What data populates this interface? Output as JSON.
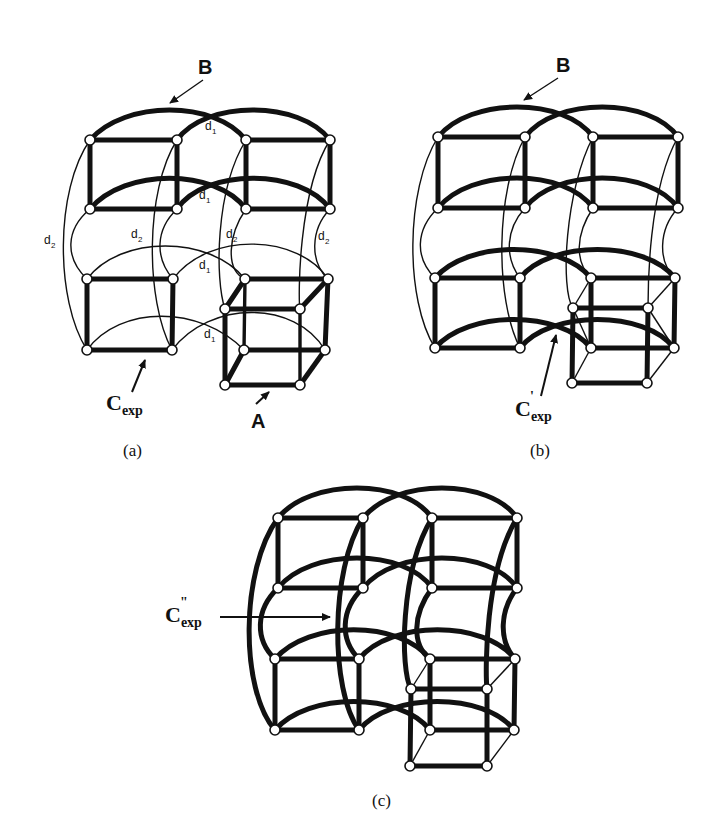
{
  "figure": {
    "panels": [
      {
        "id": "a",
        "caption": "(a)",
        "labels": {
          "top_cube": "B",
          "bottom_cube": "A",
          "cycle_main": "C",
          "cycle_sub": "exp",
          "cycle_prime": ""
        },
        "edge_labels": {
          "d1": "d",
          "d1_sub": "1",
          "d2": "d",
          "d2_sub": "2"
        }
      },
      {
        "id": "b",
        "caption": "(b)",
        "labels": {
          "top_cube": "B",
          "cycle_main": "C",
          "cycle_sub": "exp",
          "cycle_prime": "'"
        }
      },
      {
        "id": "c",
        "caption": "(c)",
        "labels": {
          "cycle_main": "C",
          "cycle_sub": "exp",
          "cycle_prime": "\""
        }
      }
    ],
    "colors": {
      "ink": "#111111",
      "node_fill": "#ffffff",
      "background": "#ffffff"
    }
  }
}
